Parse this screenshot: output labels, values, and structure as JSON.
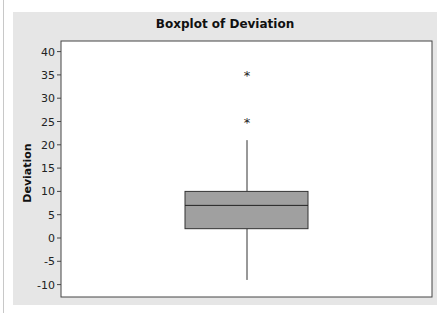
{
  "chart_data": {
    "type": "boxplot",
    "title": "Boxplot of Deviation",
    "xlabel": "",
    "ylabel": "Deviation",
    "ylim": [
      -12,
      42
    ],
    "yticks": [
      40,
      35,
      30,
      25,
      20,
      15,
      10,
      5,
      0,
      -5,
      -10
    ],
    "ytick_labels": [
      "40",
      "35",
      "30",
      "25",
      "20",
      "15",
      "10",
      "5",
      "0",
      "-5",
      "-10"
    ],
    "grid": false,
    "series": [
      {
        "name": "Deviation",
        "q1": 2,
        "median": 7,
        "q3": 10,
        "whisker_low": -9,
        "whisker_high": 21,
        "outliers": [
          25,
          35
        ]
      }
    ],
    "colors": {
      "box_fill": "#a0a0a0",
      "box_stroke": "#333333",
      "panel_bg": "#e6e6e6",
      "plot_bg": "#ffffff"
    },
    "outlier_marker": "*"
  }
}
